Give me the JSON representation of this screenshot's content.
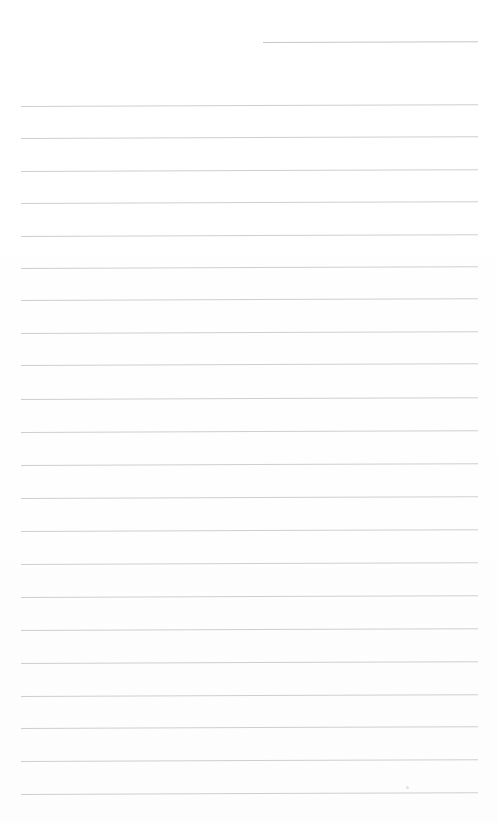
{
  "page": {
    "kind": "blank-lined-paper",
    "width": 497,
    "height": 823,
    "background_color": "#ffffff",
    "rule_color": "#c9ccd0",
    "rule_thickness_px": 1,
    "left_margin_px": 20,
    "right_margin_px": 478,
    "rule_spacing_px": 32.4,
    "total_rules": 23,
    "content_text": ""
  },
  "rules": [
    {
      "id": "rule-header",
      "y": 42,
      "x_start": 263,
      "x_end": 478,
      "slant_deg": -0.18,
      "short": true
    },
    {
      "id": "rule-1",
      "y": 106,
      "x_start": 21,
      "x_end": 478,
      "slant_deg": -0.22,
      "short": false
    },
    {
      "id": "rule-2",
      "y": 138.4,
      "x_start": 21,
      "x_end": 478,
      "slant_deg": -0.22,
      "short": false
    },
    {
      "id": "rule-3",
      "y": 170.8,
      "x_start": 21,
      "x_end": 478,
      "slant_deg": -0.22,
      "short": false
    },
    {
      "id": "rule-4",
      "y": 203.2,
      "x_start": 21,
      "x_end": 478,
      "slant_deg": -0.22,
      "short": false
    },
    {
      "id": "rule-5",
      "y": 235.6,
      "x_start": 21,
      "x_end": 478,
      "slant_deg": -0.22,
      "short": false
    },
    {
      "id": "rule-6",
      "y": 268.0,
      "x_start": 21,
      "x_end": 478,
      "slant_deg": -0.22,
      "short": false
    },
    {
      "id": "rule-7",
      "y": 300.4,
      "x_start": 21,
      "x_end": 478,
      "slant_deg": -0.22,
      "short": false
    },
    {
      "id": "rule-8",
      "y": 332.8,
      "x_start": 21,
      "x_end": 478,
      "slant_deg": -0.22,
      "short": false
    },
    {
      "id": "rule-9",
      "y": 365.2,
      "x_start": 21,
      "x_end": 478,
      "slant_deg": -0.22,
      "short": false
    },
    {
      "id": "rule-10",
      "y": 399.0,
      "x_start": 21,
      "x_end": 478,
      "slant_deg": -0.22,
      "short": false
    },
    {
      "id": "rule-11",
      "y": 432.0,
      "x_start": 21,
      "x_end": 478,
      "slant_deg": -0.22,
      "short": false
    },
    {
      "id": "rule-12",
      "y": 465.0,
      "x_start": 21,
      "x_end": 478,
      "slant_deg": -0.22,
      "short": false
    },
    {
      "id": "rule-13",
      "y": 497.5,
      "x_start": 21,
      "x_end": 478,
      "slant_deg": -0.22,
      "short": false
    },
    {
      "id": "rule-14",
      "y": 530.5,
      "x_start": 21,
      "x_end": 478,
      "slant_deg": -0.22,
      "short": false
    },
    {
      "id": "rule-15",
      "y": 563.5,
      "x_start": 21,
      "x_end": 478,
      "slant_deg": -0.22,
      "short": false
    },
    {
      "id": "rule-16",
      "y": 597.0,
      "x_start": 21,
      "x_end": 478,
      "slant_deg": -0.22,
      "short": false
    },
    {
      "id": "rule-17",
      "y": 630.0,
      "x_start": 21,
      "x_end": 478,
      "slant_deg": -0.22,
      "short": false
    },
    {
      "id": "rule-18",
      "y": 662.5,
      "x_start": 21,
      "x_end": 478,
      "slant_deg": -0.22,
      "short": false
    },
    {
      "id": "rule-19",
      "y": 695.5,
      "x_start": 21,
      "x_end": 478,
      "slant_deg": -0.22,
      "short": false
    },
    {
      "id": "rule-20",
      "y": 728.0,
      "x_start": 21,
      "x_end": 478,
      "slant_deg": -0.22,
      "short": false
    },
    {
      "id": "rule-21",
      "y": 761.0,
      "x_start": 21,
      "x_end": 478,
      "slant_deg": -0.22,
      "short": false
    },
    {
      "id": "rule-22",
      "y": 794.0,
      "x_start": 21,
      "x_end": 478,
      "slant_deg": -0.22,
      "short": false
    }
  ],
  "marks": [
    {
      "id": "speck-1",
      "x": 406,
      "y": 786
    }
  ]
}
